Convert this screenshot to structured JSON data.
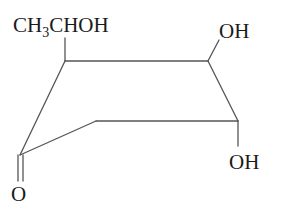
{
  "diagram": {
    "type": "skeletal-structural-formula",
    "ring": "six-membered carbocycle (perspective/chair-like drawing)",
    "labels": {
      "substituent_top_left": {
        "prefix": "CH",
        "subscript": "3",
        "suffix": "CHOH"
      },
      "substituent_top_right": "OH",
      "substituent_bottom_right": "OH",
      "carbonyl_oxygen": "O"
    },
    "colors": {
      "bond": "#555555",
      "text": "#1a1a1a",
      "background": "#ffffff"
    }
  }
}
